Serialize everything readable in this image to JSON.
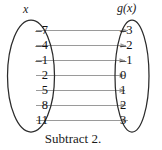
{
  "diagram": {
    "type": "mapping-diagram",
    "domain_header": "x",
    "range_header": "g(x)",
    "caption": "Subtract 2.",
    "domain_values": [
      "–7",
      "–4",
      "–1",
      "2",
      "5",
      "8",
      "11"
    ],
    "range_values": [
      "–3",
      "–2",
      "–1",
      "0",
      "1",
      "2",
      "3"
    ],
    "pairs": [
      {
        "input": "–7",
        "output": "–3"
      },
      {
        "input": "–4",
        "output": "–2"
      },
      {
        "input": "–1",
        "output": "–1"
      },
      {
        "input": "2",
        "output": "0"
      },
      {
        "input": "5",
        "output": "1"
      },
      {
        "input": "8",
        "output": "2"
      },
      {
        "input": "11",
        "output": "3"
      }
    ],
    "colors": {
      "background": "#ffffff",
      "text": "#111111",
      "ellipse_stroke": "#2b2b2b",
      "arrow": "#9a9a9a"
    }
  }
}
